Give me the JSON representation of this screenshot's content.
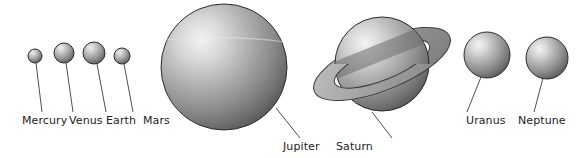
{
  "figure": {
    "background_color": "#ffffff",
    "label_color": "#1c1c1c",
    "leader_line_color": "#3a3a3a",
    "sphere_outline_color": "#2b2b2b",
    "sphere_light_color": "#f2f2f2",
    "sphere_mid_color": "#a8a8a8",
    "sphere_dark_color": "#5a5a5a",
    "ring_light_color": "#d9d9d9",
    "ring_dark_color": "#6e6e6e"
  },
  "planets": [
    {
      "id": "mercury",
      "label": "Mercury",
      "cx": 35,
      "cy": 56,
      "r": 7,
      "label_x": 35,
      "label_y": 124,
      "leader_x1": 36,
      "leader_y1": 63,
      "leader_x2": 42,
      "leader_y2": 112
    },
    {
      "id": "venus",
      "label": "Venus",
      "cx": 64,
      "cy": 53,
      "r": 10,
      "label_x": 85,
      "label_y": 124,
      "leader_x1": 66,
      "leader_y1": 63,
      "leader_x2": 73,
      "leader_y2": 112
    },
    {
      "id": "earth",
      "label": "Earth",
      "cx": 94,
      "cy": 53,
      "r": 11,
      "label_x": 125,
      "label_y": 124,
      "leader_x1": 97,
      "leader_y1": 64,
      "leader_x2": 106,
      "leader_y2": 112
    },
    {
      "id": "mars",
      "label": "Mars",
      "cx": 122,
      "cy": 56,
      "r": 8,
      "label_x": 161,
      "label_y": 124,
      "leader_x1": 124,
      "leader_y1": 64,
      "leader_x2": 133,
      "leader_y2": 112
    },
    {
      "id": "jupiter",
      "label": "Jupiter",
      "cx": 224,
      "cy": 67,
      "r": 63,
      "label_x": 311,
      "label_y": 150,
      "leader_x1": 276,
      "leader_y1": 108,
      "leader_x2": 300,
      "leader_y2": 138
    },
    {
      "id": "saturn",
      "label": "Saturn",
      "cx": 382,
      "cy": 64,
      "r": 47,
      "label_x": 362,
      "label_y": 150,
      "leader_x1": 372,
      "leader_y1": 112,
      "leader_x2": 392,
      "leader_y2": 138,
      "ring": {
        "rx": 73,
        "ry": 26,
        "inner_rx": 44,
        "inner_ry": 15,
        "tilt_deg": -22
      }
    },
    {
      "id": "uranus",
      "label": "Uranus",
      "cx": 487,
      "cy": 55,
      "r": 23,
      "label_x": 475,
      "label_y": 124,
      "leader_x1": 481,
      "leader_y1": 77,
      "leader_x2": 467,
      "leader_y2": 112
    },
    {
      "id": "neptune",
      "label": "Neptune",
      "cx": 547,
      "cy": 58,
      "r": 21,
      "label_x": 528,
      "label_y": 124,
      "leader_x1": 543,
      "leader_y1": 78,
      "leader_x2": 534,
      "leader_y2": 112
    }
  ]
}
